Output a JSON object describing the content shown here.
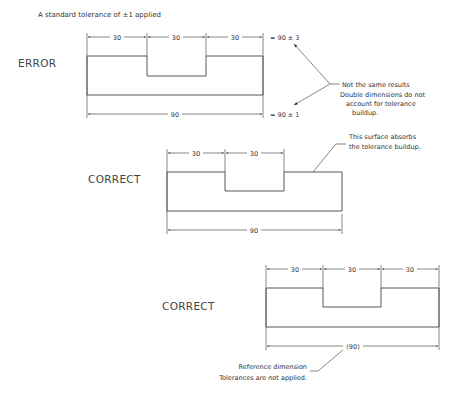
{
  "title": "A standard tolerance of ±1 applied",
  "examples": [
    {
      "label": "ERROR",
      "top_dims": [
        "30",
        "30",
        "30"
      ],
      "overall_dim": "90",
      "top_result": "= 90 ± 3",
      "bottom_result": "= 90 ± 1",
      "note_title": "Not the same results",
      "note_lines": [
        "Double dimensions do not",
        "account for tolerance",
        "buildup."
      ]
    },
    {
      "label": "CORRECT",
      "top_dims": [
        "30",
        "30"
      ],
      "overall_dim": "90",
      "note_lines": [
        "This surface absorbs",
        "the tolerance buildup."
      ]
    },
    {
      "label": "CORRECT",
      "top_dims": [
        "30",
        "30",
        "30"
      ],
      "overall_dim": "(90)",
      "note_lines": [
        "Reference dimension",
        "Tolerances are not applied."
      ]
    }
  ]
}
